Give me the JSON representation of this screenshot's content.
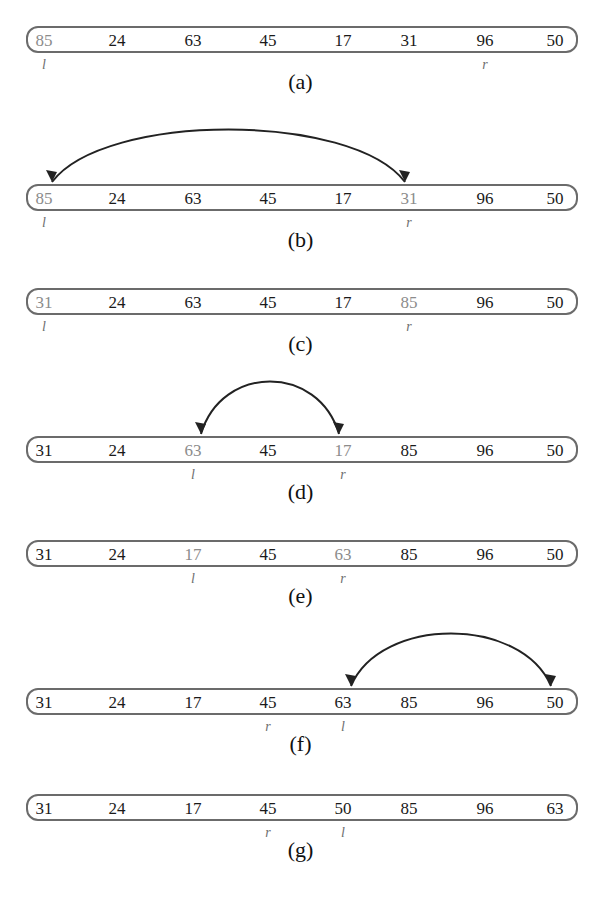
{
  "figure": {
    "column_x": [
      44,
      117,
      193,
      268,
      343,
      409,
      485,
      555
    ],
    "steps": [
      {
        "caption": "(a)",
        "box_top": 26,
        "values": [
          "85",
          "24",
          "63",
          "45",
          "17",
          "31",
          "96",
          "50"
        ],
        "highlight": [
          0
        ],
        "pointers": [
          {
            "label": "l",
            "index": 0
          },
          {
            "label": "r",
            "index": 6
          }
        ],
        "swap": null
      },
      {
        "caption": "(b)",
        "box_top": 184,
        "values": [
          "85",
          "24",
          "63",
          "45",
          "17",
          "31",
          "96",
          "50"
        ],
        "highlight": [
          0,
          5
        ],
        "pointers": [
          {
            "label": "l",
            "index": 0
          },
          {
            "label": "r",
            "index": 5
          }
        ],
        "swap": [
          0,
          5
        ]
      },
      {
        "caption": "(c)",
        "box_top": 288,
        "values": [
          "31",
          "24",
          "63",
          "45",
          "17",
          "85",
          "96",
          "50"
        ],
        "highlight": [
          0,
          5
        ],
        "pointers": [
          {
            "label": "l",
            "index": 0
          },
          {
            "label": "r",
            "index": 5
          }
        ],
        "swap": null
      },
      {
        "caption": "(d)",
        "box_top": 436,
        "values": [
          "31",
          "24",
          "63",
          "45",
          "17",
          "85",
          "96",
          "50"
        ],
        "highlight": [
          2,
          4
        ],
        "pointers": [
          {
            "label": "l",
            "index": 2
          },
          {
            "label": "r",
            "index": 4
          }
        ],
        "swap": [
          2,
          4
        ]
      },
      {
        "caption": "(e)",
        "box_top": 540,
        "values": [
          "31",
          "24",
          "17",
          "45",
          "63",
          "85",
          "96",
          "50"
        ],
        "highlight": [
          2,
          4
        ],
        "pointers": [
          {
            "label": "l",
            "index": 2
          },
          {
            "label": "r",
            "index": 4
          }
        ],
        "swap": null
      },
      {
        "caption": "(f)",
        "box_top": 688,
        "values": [
          "31",
          "24",
          "17",
          "45",
          "63",
          "85",
          "96",
          "50"
        ],
        "highlight": [],
        "pointers": [
          {
            "label": "r",
            "index": 3
          },
          {
            "label": "l",
            "index": 4
          }
        ],
        "swap": [
          4,
          7
        ]
      },
      {
        "caption": "(g)",
        "box_top": 794,
        "values": [
          "31",
          "24",
          "17",
          "45",
          "50",
          "85",
          "96",
          "63"
        ],
        "highlight": [],
        "pointers": [
          {
            "label": "r",
            "index": 3
          },
          {
            "label": "l",
            "index": 4
          }
        ],
        "swap": null
      }
    ]
  },
  "colors": {
    "border": "#6b6b6b",
    "text": "#1a1a1a",
    "highlight_text": "#8c8c8c",
    "pointer": "#6e6e6e",
    "arrow": "#222222"
  }
}
